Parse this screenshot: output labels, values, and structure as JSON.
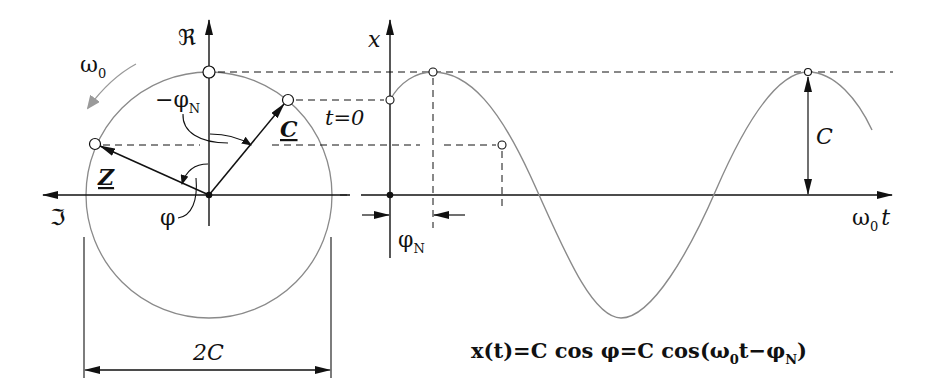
{
  "diagram": {
    "phasor": {
      "real_axis_label": "ℜ",
      "imag_axis_label": "ℑ",
      "rotation_label": "ω",
      "rotation_sub": "0",
      "phasor_C_label": "C",
      "phasor_Z_label": "Z",
      "angle_phiN_label": "−φ",
      "angle_phiN_sub": "N",
      "angle_phi_label": "φ",
      "diameter_label": "2C"
    },
    "time_plot": {
      "y_axis_label": "x",
      "x_axis_label": "ω",
      "x_axis_sub": "0",
      "x_axis_suffix": "t",
      "t0_label": "t=0",
      "amplitude_label": "C",
      "phase_shift_label": "φ",
      "phase_shift_sub": "N"
    },
    "formula": {
      "lhs": "x(t)=C cos φ=C cos(ω",
      "sub0": "0",
      "mid": "t−φ",
      "subN": "N",
      "rhs": ")"
    },
    "colors": {
      "ink": "#111111",
      "curve": "#8a8a8a",
      "rotation_arrow": "#9a9a9a"
    }
  }
}
